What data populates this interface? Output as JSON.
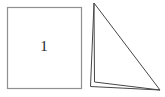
{
  "figure": {
    "square_label": "1"
  },
  "colors": {
    "background": "#ffffff",
    "square_border": "#8f8f8f",
    "triangle_stroke": "#474747",
    "label": "#1f1f1f"
  }
}
